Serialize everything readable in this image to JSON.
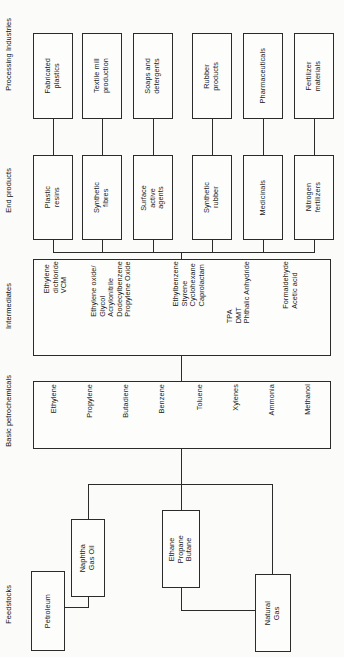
{
  "diagram": {
    "orientation": "rotated-90",
    "tiers": [
      {
        "key": "processing_industries",
        "label": "Processing Industries"
      },
      {
        "key": "end_products",
        "label": "End products"
      },
      {
        "key": "intermediates",
        "label": "Intermediates"
      },
      {
        "key": "basic_petrochemicals",
        "label": "Basic petrochemicals"
      },
      {
        "key": "feedstocks",
        "label": "Feedstocks"
      }
    ],
    "processing_industries": {
      "label": "Processing Industries",
      "boxes": [
        {
          "name": "fabricated-plastics",
          "text": "Fabricated\nplastics"
        },
        {
          "name": "textile-mill",
          "text": "Textile mill\nproduction"
        },
        {
          "name": "soaps-detergents",
          "text": "Soaps and\ndetergents"
        },
        {
          "name": "rubber-products",
          "text": "Rubber\nproducts"
        },
        {
          "name": "pharmaceuticals",
          "text": "Pharmaceuticals"
        },
        {
          "name": "fertilizer-materials",
          "text": "Fertilizer\nmaterials"
        }
      ]
    },
    "end_products": {
      "label": "End products",
      "boxes": [
        {
          "name": "plastic-resins",
          "text": "Plastic\nresins"
        },
        {
          "name": "synthetic-fibres",
          "text": "Synthetic\nfibres"
        },
        {
          "name": "surface-active-agents",
          "text": "Surface\nactive\nagents"
        },
        {
          "name": "synthetic-rubber",
          "text": "Synthetic\nrubber"
        },
        {
          "name": "medicinals",
          "text": "Medicinals"
        },
        {
          "name": "nitrogen-fertilizers",
          "text": "Nitrogen\nfertilizers"
        }
      ]
    },
    "intermediates": {
      "label": "Intermediates",
      "groups": [
        {
          "name": "group-chlorinated",
          "text": "Ethylene\ndichloride\nVCM"
        },
        {
          "name": "group-oxides",
          "text": "Ethylene oxide/\nGlycol\nAcrylonitrile\nDodecylbenzene\nPropylene Oxide"
        },
        {
          "name": "group-aromatics",
          "text": "Ethylbenzene\nStyrene\nCyclohexane\nCaprolactam"
        },
        {
          "name": "group-acids",
          "text": "TPA\nDMT\nPhthalic Anhydride"
        },
        {
          "name": "group-oxygenates",
          "text": "Formaldehyde\nAcetic acid"
        }
      ]
    },
    "basic_petrochemicals": {
      "label": "Basic petrochemicals",
      "items": [
        {
          "name": "ethylene",
          "text": "Ethylene"
        },
        {
          "name": "propylene",
          "text": "Propylene"
        },
        {
          "name": "butadiene",
          "text": "Butadiene"
        },
        {
          "name": "benzene",
          "text": "Benzene"
        },
        {
          "name": "toluene",
          "text": "Toluene"
        },
        {
          "name": "xylenes",
          "text": "Xylenes"
        },
        {
          "name": "ammonia",
          "text": "Ammonia"
        },
        {
          "name": "methanol",
          "text": "Methanol"
        }
      ]
    },
    "feedstocks": {
      "label": "Feedstocks",
      "boxes": [
        {
          "name": "naphtha-gas-oil",
          "text": "Naphtha\nGas Oil"
        },
        {
          "name": "ethane-propane-butane",
          "text": "Ethane\nPropane\nButane"
        },
        {
          "name": "petroleum",
          "text": "Petroleum"
        },
        {
          "name": "natural-gas",
          "text": "Natural\nGas"
        }
      ]
    }
  },
  "colors": {
    "stroke": "#2b2b2b",
    "background": "#fbfbfa",
    "box_fill": "#fdfdfc",
    "text": "#1a1a1a"
  }
}
